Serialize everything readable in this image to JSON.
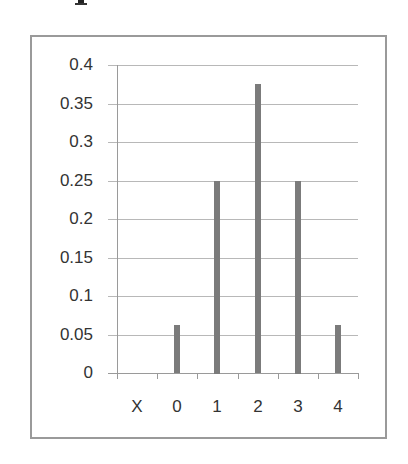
{
  "page": {
    "top_fragment": "p"
  },
  "chart_data": {
    "type": "bar",
    "title": "",
    "xlabel": "",
    "ylabel": "",
    "categories": [
      "X",
      "0",
      "1",
      "2",
      "3",
      "4"
    ],
    "values": [
      null,
      0.0625,
      0.25,
      0.375,
      0.25,
      0.0625
    ],
    "ylim": [
      0,
      0.4
    ],
    "yticks": [
      "0",
      "0.05",
      "0.1",
      "0.15",
      "0.2",
      "0.25",
      "0.3",
      "0.35",
      "0.4"
    ],
    "grid": true,
    "legend": null,
    "bar_color": "#7b7b7b",
    "border_color": "#9a9a9a"
  }
}
